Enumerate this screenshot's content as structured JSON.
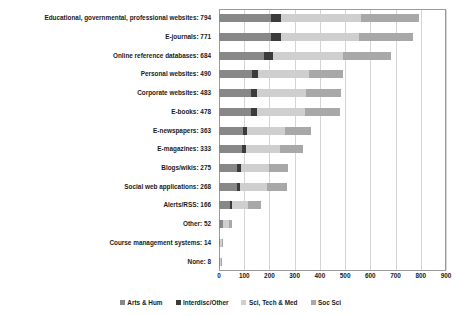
{
  "chart_data": {
    "type": "bar",
    "orientation": "horizontal",
    "stacked": true,
    "title": "",
    "xlabel": "",
    "ylabel": "",
    "xlim": [
      0,
      900
    ],
    "xticks": [
      0,
      100,
      200,
      300,
      400,
      500,
      600,
      700,
      800,
      900
    ],
    "grid": true,
    "legend_position": "bottom",
    "categories": [
      "Educational, governmental, professional websites",
      "E-journals",
      "Online reference databases",
      "Personal websites",
      "Corporate websites",
      "E-books",
      "E-newspapers",
      "E-magazines",
      "Blogs/wikis",
      "Social web applications",
      "Alerts/RSS",
      "Other",
      "Course management systems",
      "None"
    ],
    "totals": [
      794,
      771,
      684,
      490,
      483,
      478,
      363,
      333,
      275,
      268,
      166,
      52,
      14,
      8
    ],
    "category_labels": [
      "Educational, governmental, professional websites: 794",
      "E-journals: 771",
      "Online reference databases: 684",
      "Personal websites: 490",
      "Corporate websites: 483",
      "E-books: 478",
      "E-newspapers: 363",
      "E-magazines: 333",
      "Blogs/wikis: 275",
      "Social web applications: 268",
      "Alerts/RSS: 166",
      "Other: 52",
      "Course management systems: 14",
      "None: 8"
    ],
    "series": [
      {
        "name": "Arts & Hum",
        "color": "#888888",
        "values": [
          205,
          205,
          180,
          130,
          125,
          125,
          95,
          90,
          72,
          70,
          42,
          14,
          4,
          2
        ]
      },
      {
        "name": "Interdisc/Other",
        "color": "#3b3b3b",
        "values": [
          40,
          40,
          35,
          25,
          25,
          24,
          18,
          17,
          14,
          13,
          8,
          3,
          1,
          1
        ]
      },
      {
        "name": "Sci, Tech & Med",
        "color": "#cfcfcf",
        "values": [
          320,
          310,
          275,
          200,
          195,
          193,
          147,
          134,
          111,
          108,
          67,
          21,
          6,
          3
        ]
      },
      {
        "name": "Soc Sci",
        "color": "#a8a8a8",
        "values": [
          229,
          216,
          194,
          135,
          138,
          136,
          103,
          92,
          78,
          77,
          49,
          14,
          3,
          2
        ]
      }
    ]
  },
  "legend": {
    "items": [
      {
        "label": "Arts & Hum"
      },
      {
        "label": "Interdisc/Other"
      },
      {
        "label": "Sci, Tech & Med"
      },
      {
        "label": "Soc Sci"
      }
    ]
  }
}
